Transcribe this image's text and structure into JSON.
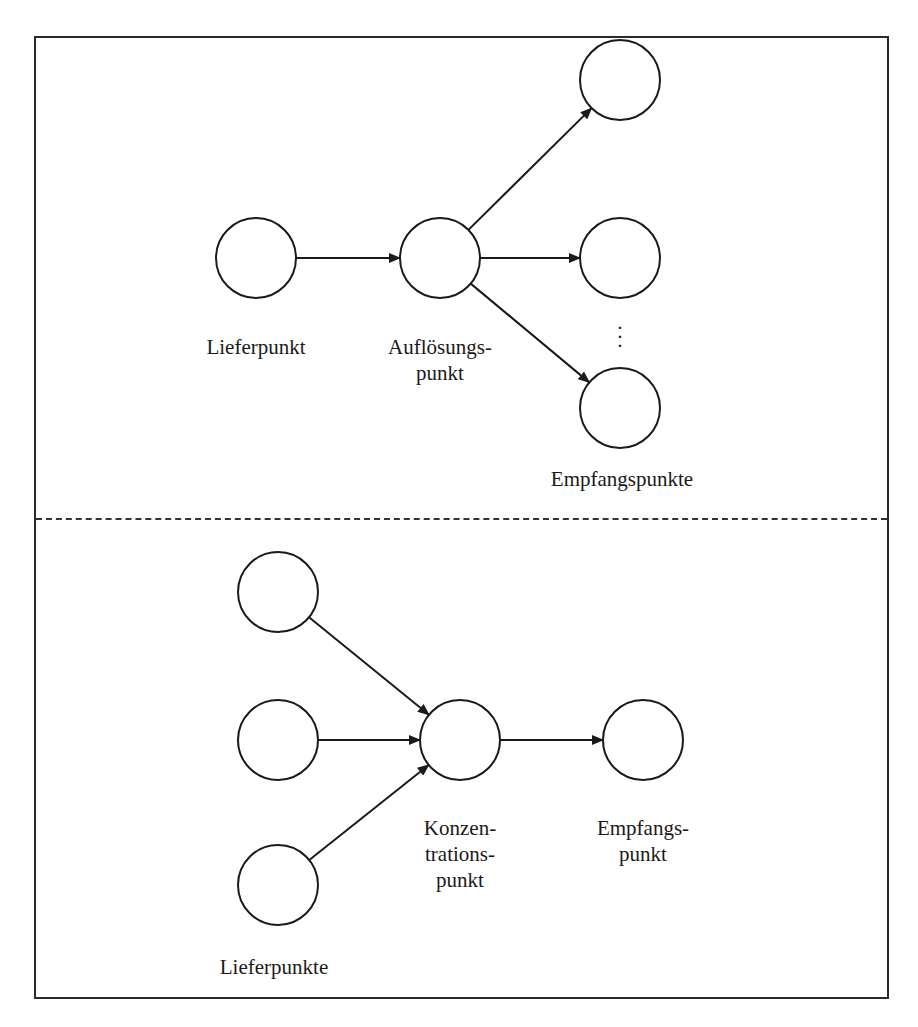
{
  "diagram": {
    "colors": {
      "stroke": "#1a1a1a",
      "background": "#ffffff"
    },
    "top_section": {
      "name": "distribution",
      "labels": {
        "supplier": "Lieferpunkt",
        "break_bulk_line1": "Auflösungs-",
        "break_bulk_line2": "punkt",
        "receivers": "Empfangspunkte"
      },
      "ellipsis": "⋮",
      "nodes": [
        {
          "id": "lieferpunkt",
          "cx": 256,
          "cy": 258,
          "r": 40
        },
        {
          "id": "aufloesungspunkt",
          "cx": 440,
          "cy": 258,
          "r": 40
        },
        {
          "id": "empfangspunkt-1",
          "cx": 620,
          "cy": 80,
          "r": 40
        },
        {
          "id": "empfangspunkt-2",
          "cx": 620,
          "cy": 258,
          "r": 40
        },
        {
          "id": "empfangspunkt-n",
          "cx": 620,
          "cy": 408,
          "r": 40
        }
      ],
      "edges": [
        {
          "from": "lieferpunkt",
          "to": "aufloesungspunkt"
        },
        {
          "from": "aufloesungspunkt",
          "to": "empfangspunkt-1"
        },
        {
          "from": "aufloesungspunkt",
          "to": "empfangspunkt-2"
        },
        {
          "from": "aufloesungspunkt",
          "to": "empfangspunkt-n"
        }
      ]
    },
    "bottom_section": {
      "name": "consolidation",
      "labels": {
        "consolidation_line1": "Konzen-",
        "consolidation_line2": "trations-",
        "consolidation_line3": "punkt",
        "receiver_line1": "Empfangs-",
        "receiver_line2": "punkt",
        "suppliers": "Lieferpunkte"
      },
      "nodes": [
        {
          "id": "lieferpunkt-1",
          "cx": 278,
          "cy": 592,
          "r": 40
        },
        {
          "id": "lieferpunkt-2",
          "cx": 278,
          "cy": 740,
          "r": 40
        },
        {
          "id": "lieferpunkt-3",
          "cx": 278,
          "cy": 885,
          "r": 40
        },
        {
          "id": "konzentrationspunkt",
          "cx": 460,
          "cy": 740,
          "r": 40
        },
        {
          "id": "empfangspunkt",
          "cx": 643,
          "cy": 740,
          "r": 40
        }
      ],
      "edges": [
        {
          "from": "lieferpunkt-1",
          "to": "konzentrationspunkt"
        },
        {
          "from": "lieferpunkt-2",
          "to": "konzentrationspunkt"
        },
        {
          "from": "lieferpunkt-3",
          "to": "konzentrationspunkt"
        },
        {
          "from": "konzentrationspunkt",
          "to": "empfangspunkt"
        }
      ]
    }
  }
}
